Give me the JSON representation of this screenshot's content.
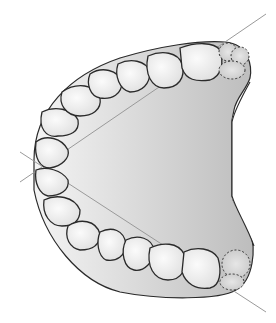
{
  "diagram": {
    "colors": {
      "background": "#ffffff",
      "palate_light": "#f2f2f2",
      "palate_dark": "#c4c4c4",
      "tooth_fill": "#ececec",
      "outline": "#2a2a2a",
      "reference_line": "#9a9a9a"
    },
    "reference_lines": [
      {
        "name": "upper-diagonal",
        "from": [
          20,
          182
        ],
        "to": [
          266,
          14
        ]
      },
      {
        "name": "lower-diagonal",
        "from": [
          28,
          150
        ],
        "to": [
          266,
          312
        ]
      }
    ],
    "teeth_upper": 7,
    "teeth_lower": 7,
    "unerupted_molars": 2
  }
}
